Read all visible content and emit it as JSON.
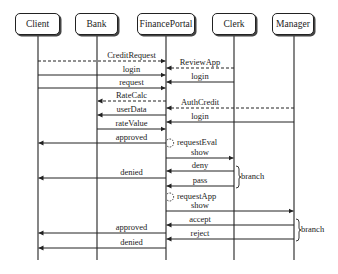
{
  "diagram": {
    "type": "sequence",
    "actors": [
      {
        "name": "Client",
        "x": 38,
        "left": 15,
        "width": 45
      },
      {
        "name": "Bank",
        "x": 97,
        "left": 75,
        "width": 43
      },
      {
        "name": "FinancePortal",
        "x": 166,
        "left": 137,
        "width": 58
      },
      {
        "name": "Clerk",
        "x": 234,
        "left": 212,
        "width": 44
      },
      {
        "name": "Manager",
        "x": 294,
        "left": 272,
        "width": 42
      }
    ],
    "messages": [
      {
        "label": "CreditRequest",
        "from": "Client",
        "to": "FinancePortal",
        "y": 61,
        "dashed": true
      },
      {
        "label": "ReviewApp",
        "from": "Clerk",
        "to": "FinancePortal",
        "y": 68,
        "dashed": true
      },
      {
        "label": "login",
        "from": "Client",
        "to": "FinancePortal",
        "y": 75,
        "dashed": false
      },
      {
        "label": "login",
        "from": "Clerk",
        "to": "FinancePortal",
        "y": 82,
        "dashed": false
      },
      {
        "label": "request",
        "from": "Client",
        "to": "FinancePortal",
        "y": 88,
        "dashed": false
      },
      {
        "label": "RateCalc",
        "from": "FinancePortal",
        "to": "Bank",
        "y": 101,
        "dashed": true
      },
      {
        "label": "AuthCredit",
        "from": "Manager",
        "to": "FinancePortal",
        "y": 108,
        "dashed": true
      },
      {
        "label": "userData",
        "from": "FinancePortal",
        "to": "Bank",
        "y": 115,
        "dashed": false
      },
      {
        "label": "login",
        "from": "Manager",
        "to": "FinancePortal",
        "y": 122,
        "dashed": false
      },
      {
        "label": "rateValue",
        "from": "Bank",
        "to": "FinancePortal",
        "y": 129,
        "dashed": false
      },
      {
        "label": "approved",
        "from": "FinancePortal",
        "to": "Client",
        "y": 143,
        "dashed": false
      },
      {
        "label": "show",
        "from": "FinancePortal",
        "to": "Clerk",
        "y": 158,
        "dashed": false
      },
      {
        "label": "deny",
        "from": "Clerk",
        "to": "FinancePortal",
        "y": 171,
        "dashed": false
      },
      {
        "label": "denied",
        "from": "FinancePortal",
        "to": "Client",
        "y": 178,
        "dashed": false
      },
      {
        "label": "pass",
        "from": "Clerk",
        "to": "FinancePortal",
        "y": 186,
        "dashed": false
      },
      {
        "label": "show",
        "from": "FinancePortal",
        "to": "Manager",
        "y": 211,
        "dashed": false
      },
      {
        "label": "accept",
        "from": "Manager",
        "to": "FinancePortal",
        "y": 225,
        "dashed": false
      },
      {
        "label": "approved",
        "from": "FinancePortal",
        "to": "Client",
        "y": 233,
        "dashed": false
      },
      {
        "label": "reject",
        "from": "Manager",
        "to": "FinancePortal",
        "y": 239,
        "dashed": false
      },
      {
        "label": "denied",
        "from": "FinancePortal",
        "to": "Client",
        "y": 248,
        "dashed": false
      }
    ],
    "self_calls": [
      {
        "label": "requestEval",
        "actor": "FinancePortal",
        "y": 143
      },
      {
        "label": "requestApp",
        "actor": "FinancePortal",
        "y": 197
      }
    ],
    "branches": [
      {
        "label": "branch",
        "x": 236,
        "y_top": 166,
        "y_bottom": 188
      },
      {
        "label": "branch",
        "x": 296,
        "y_top": 219,
        "y_bottom": 241
      }
    ],
    "lifeline_top": 35,
    "lifeline_bottom": 260
  }
}
